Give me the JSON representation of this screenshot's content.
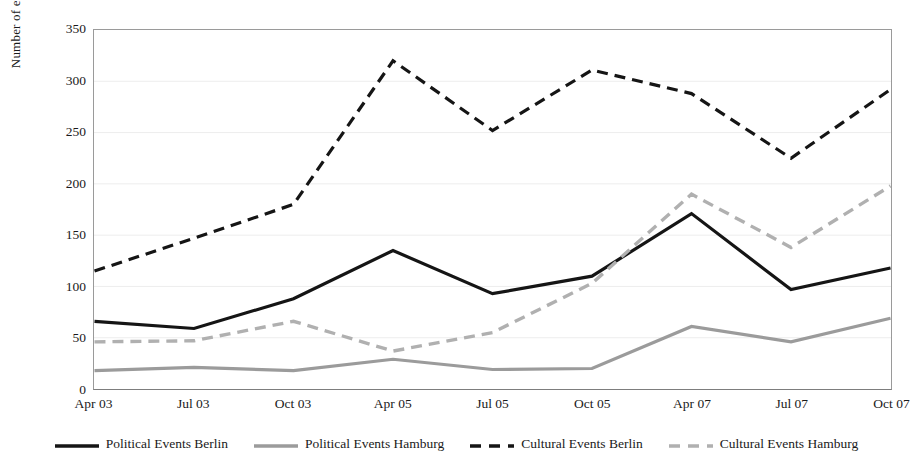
{
  "chart_data": {
    "type": "line",
    "title": "",
    "xlabel": "",
    "ylabel": "Number of events",
    "categories": [
      "Apr 03",
      "Jul 03",
      "Oct 03",
      "Apr 05",
      "Jul 05",
      "Oct 05",
      "Apr 07",
      "Jul 07",
      "Oct 07"
    ],
    "ylim": [
      0,
      350
    ],
    "yticks": [
      0,
      50,
      100,
      150,
      200,
      250,
      300,
      350
    ],
    "grid": true,
    "legend_position": "bottom",
    "series": [
      {
        "name": "Political Events Berlin",
        "color": "#151515",
        "style": "solid",
        "width": 3.2,
        "values": [
          66,
          59,
          88,
          135,
          93,
          110,
          171,
          97,
          118
        ]
      },
      {
        "name": "Political Events Hamburg",
        "color": "#9b9b9b",
        "style": "solid",
        "width": 3.2,
        "values": [
          18,
          21,
          18,
          29,
          19,
          20,
          61,
          46,
          69
        ]
      },
      {
        "name": "Cultural Events Berlin",
        "color": "#151515",
        "style": "dashed",
        "width": 3.2,
        "values": [
          115,
          147,
          180,
          320,
          252,
          311,
          288,
          225,
          292
        ]
      },
      {
        "name": "Cultural Events Hamburg",
        "color": "#b0b0b0",
        "style": "dashed",
        "width": 3.4,
        "values": [
          46,
          47,
          66,
          37,
          55,
          103,
          190,
          138,
          198
        ]
      }
    ]
  },
  "axis": {
    "y_title": "Number of events",
    "y_tick_labels": [
      "0",
      "50",
      "100",
      "150",
      "200",
      "250",
      "300",
      "350"
    ],
    "x_tick_labels": [
      "Apr 03",
      "Jul 03",
      "Oct 03",
      "Apr 05",
      "Jul 05",
      "Oct 05",
      "Apr 07",
      "Jul 07",
      "Oct 07"
    ]
  },
  "legend": {
    "items": [
      {
        "label": "Political Events Berlin",
        "color": "#151515",
        "style": "solid"
      },
      {
        "label": "Political Events Hamburg",
        "color": "#9b9b9b",
        "style": "solid"
      },
      {
        "label": "Cultural Events Berlin",
        "color": "#151515",
        "style": "dashed"
      },
      {
        "label": "Cultural Events Hamburg",
        "color": "#b0b0b0",
        "style": "dashed"
      }
    ]
  },
  "colors": {
    "frame": "#9a9a9a",
    "grid": "#ededed",
    "background": "#ffffff"
  }
}
